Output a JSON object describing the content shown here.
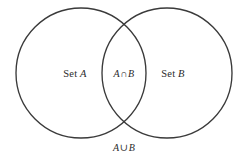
{
  "figure": {
    "type": "venn-diagram",
    "background_color": "#ffffff",
    "stroke_color": "#3a3a3a",
    "text_color": "#2b2b2b",
    "width": 246,
    "height": 161
  },
  "labels": {
    "set_a": {
      "prefix": "Set ",
      "symbol": "A",
      "full": "Set A"
    },
    "set_b": {
      "prefix": "Set ",
      "symbol": "B",
      "full": "Set B"
    },
    "intersection": {
      "left": "A",
      "operator": "∩",
      "right": "B",
      "full": "A∩B"
    },
    "union": {
      "left": "A",
      "operator": "∪",
      "right": "B",
      "full": "A∪B"
    }
  },
  "geometry": {
    "circle_a": {
      "cx": 81,
      "cy": 73,
      "r": 65
    },
    "circle_b": {
      "cx": 167,
      "cy": 73,
      "r": 65
    },
    "intersection_points": [
      {
        "x": 124,
        "y": 30
      },
      {
        "x": 124,
        "y": 116
      }
    ]
  }
}
